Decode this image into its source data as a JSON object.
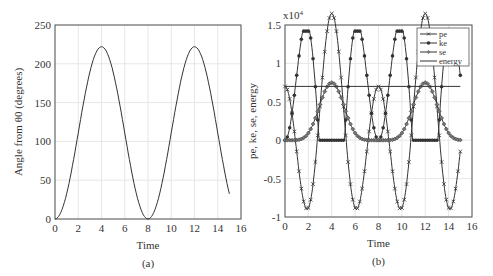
{
  "chart_data": [
    {
      "type": "line",
      "caption": "(a)",
      "title": "",
      "xlabel": "Time",
      "ylabel": "Angle from θ0 (degrees)",
      "xlim": [
        0,
        16
      ],
      "ylim": [
        0,
        250
      ],
      "xticks": [
        0,
        2,
        4,
        6,
        8,
        10,
        12,
        14,
        16
      ],
      "yticks": [
        0,
        50,
        100,
        150,
        200,
        250
      ],
      "grid": true,
      "series": [
        {
          "name": "angle",
          "x": [
            0,
            0.5,
            1,
            1.5,
            2,
            2.5,
            3,
            3.5,
            4,
            4.5,
            5,
            5.5,
            6,
            6.5,
            7,
            7.5,
            8,
            8.5,
            9,
            9.5,
            10,
            10.5,
            11,
            11.5,
            12,
            12.5,
            13,
            13.5,
            14,
            14.5,
            15
          ],
          "y": [
            0,
            8,
            32,
            69,
            111,
            153,
            190,
            214,
            222,
            214,
            190,
            153,
            111,
            69,
            32,
            8,
            0,
            8,
            32,
            69,
            111,
            153,
            190,
            214,
            222,
            214,
            190,
            153,
            111,
            69,
            32
          ]
        }
      ]
    },
    {
      "type": "line",
      "caption": "(b)",
      "title": "",
      "xlabel": "Time",
      "ylabel": "pe, ke, se, energy",
      "y_multiplier": "x10^4",
      "xlim": [
        0,
        16
      ],
      "ylim": [
        -1,
        1.5
      ],
      "xticks": [
        0,
        2,
        4,
        6,
        8,
        10,
        12,
        14,
        16
      ],
      "yticks": [
        -1,
        -0.5,
        0,
        0.5,
        1,
        1.5
      ],
      "grid": true,
      "legend": [
        "pe",
        "ke",
        "se",
        "energy"
      ],
      "legend_position": "upper right",
      "series": [
        {
          "name": "pe",
          "marker": "x",
          "x": [
            0,
            0.5,
            1,
            1.5,
            2,
            2.5,
            3,
            3.5,
            4,
            4.5,
            5,
            5.5,
            6,
            6.5,
            7,
            7.5,
            8,
            8.5,
            9,
            9.5,
            10,
            10.5,
            11,
            11.5,
            12,
            12.5,
            13,
            13.5,
            14,
            14.5,
            15
          ],
          "y": [
            0.7,
            0.6,
            0.3,
            -0.2,
            -0.7,
            -1.0,
            -0.9,
            -0.4,
            -0.05,
            -0.4,
            -0.9,
            -1.0,
            -0.7,
            -0.2,
            0.3,
            0.6,
            0.7,
            0.6,
            0.3,
            -0.2,
            -0.7,
            -1.0,
            -0.9,
            -0.4,
            -0.05,
            -0.4,
            -0.9,
            -1.0,
            -0.7,
            -0.2,
            0.3
          ]
        },
        {
          "name": "ke",
          "marker": "*",
          "x": [
            0,
            0.5,
            1,
            1.5,
            2,
            2.5,
            3,
            3.5,
            4,
            4.5,
            5,
            5.5,
            6,
            6.5,
            7,
            7.5,
            8,
            8.5,
            9,
            9.5,
            10,
            10.5,
            11,
            11.5,
            12,
            12.5,
            13,
            13.5,
            14,
            14.5,
            15
          ],
          "y": [
            0,
            0.1,
            0.4,
            0.9,
            1.35,
            1.42,
            1.05,
            0.4,
            0.02,
            0.4,
            1.05,
            1.42,
            1.35,
            0.9,
            0.4,
            0.1,
            0,
            0.1,
            0.4,
            0.9,
            1.35,
            1.42,
            1.05,
            0.4,
            0.02,
            0.4,
            1.05,
            1.42,
            1.35,
            0.9,
            0.4
          ]
        },
        {
          "name": "se",
          "marker": "diamond",
          "x": [
            0,
            0.5,
            1,
            1.5,
            2,
            2.5,
            3,
            3.5,
            4,
            4.5,
            5,
            5.5,
            6,
            6.5,
            7,
            7.5,
            8,
            8.5,
            9,
            9.5,
            10,
            10.5,
            11,
            11.5,
            12,
            12.5,
            13,
            13.5,
            14,
            14.5,
            15
          ],
          "y": [
            0,
            0,
            0.01,
            0.03,
            0.12,
            0.3,
            0.55,
            0.72,
            0.75,
            0.72,
            0.55,
            0.3,
            0.12,
            0.03,
            0.01,
            0,
            0.7,
            0,
            0.01,
            0.03,
            0.12,
            0.3,
            0.55,
            0.72,
            0.75,
            0.72,
            0.55,
            0.3,
            0.12,
            0.03,
            0.01
          ]
        },
        {
          "name": "energy",
          "marker": "none",
          "x": [
            0,
            15
          ],
          "y": [
            0.7,
            0.7
          ]
        }
      ]
    }
  ]
}
